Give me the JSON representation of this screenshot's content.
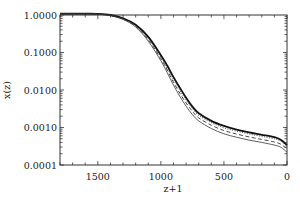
{
  "chart_data": {
    "type": "line",
    "title": "",
    "xlabel": "z+1",
    "ylabel": "x(z)",
    "x_reversed": true,
    "xlim": [
      1800,
      0
    ],
    "ylim": [
      0.0001,
      1.0
    ],
    "yscale": "log",
    "grid": false,
    "legend": null,
    "x_ticks": [
      1500,
      1000,
      500,
      0
    ],
    "x_tick_labels": [
      "1500",
      "1000",
      "500",
      "0"
    ],
    "y_ticks": [
      1.0,
      0.1,
      0.01,
      0.001,
      0.0001
    ],
    "y_tick_labels": [
      "1.0000",
      "0.1000",
      "0.0100",
      "0.0010",
      "0.0001"
    ],
    "series": [
      {
        "name": "solid (thick)",
        "style": "solid-thick",
        "x": [
          1800,
          1600,
          1500,
          1400,
          1300,
          1200,
          1100,
          1000,
          950,
          900,
          850,
          800,
          750,
          700,
          600,
          500,
          400,
          300,
          200,
          100,
          50,
          0
        ],
        "y": [
          1.08,
          1.08,
          1.07,
          1.0,
          0.82,
          0.55,
          0.26,
          0.085,
          0.045,
          0.022,
          0.0115,
          0.0062,
          0.0036,
          0.0024,
          0.0015,
          0.0011,
          0.00088,
          0.00074,
          0.00064,
          0.00055,
          0.00047,
          0.00034
        ]
      },
      {
        "name": "dotted",
        "style": "dotted",
        "x": [
          1800,
          1600,
          1500,
          1400,
          1300,
          1200,
          1100,
          1000,
          950,
          900,
          850,
          800,
          750,
          700,
          600,
          500,
          400,
          300,
          200,
          100,
          50,
          0
        ],
        "y": [
          1.08,
          1.08,
          1.06,
          0.98,
          0.79,
          0.52,
          0.24,
          0.075,
          0.038,
          0.019,
          0.0098,
          0.0054,
          0.0032,
          0.0021,
          0.00135,
          0.00098,
          0.0008,
          0.00067,
          0.00058,
          0.0005,
          0.00043,
          0.00032
        ]
      },
      {
        "name": "dashed",
        "style": "dashed",
        "x": [
          1800,
          1600,
          1500,
          1400,
          1300,
          1200,
          1100,
          1000,
          950,
          900,
          850,
          800,
          750,
          700,
          600,
          500,
          400,
          300,
          200,
          100,
          50,
          0
        ],
        "y": [
          1.08,
          1.08,
          1.06,
          0.97,
          0.78,
          0.5,
          0.22,
          0.068,
          0.034,
          0.016,
          0.0082,
          0.0045,
          0.0027,
          0.0018,
          0.00115,
          0.00083,
          0.00067,
          0.00056,
          0.00048,
          0.00041,
          0.00036,
          0.00027
        ]
      },
      {
        "name": "solid (thin)",
        "style": "solid-thin",
        "x": [
          1800,
          1600,
          1500,
          1400,
          1300,
          1200,
          1100,
          1000,
          950,
          900,
          850,
          800,
          750,
          700,
          600,
          500,
          400,
          300,
          200,
          100,
          50,
          0
        ],
        "y": [
          1.08,
          1.08,
          1.05,
          0.96,
          0.76,
          0.48,
          0.2,
          0.06,
          0.029,
          0.0135,
          0.0068,
          0.0037,
          0.0022,
          0.0015,
          0.00094,
          0.00068,
          0.00055,
          0.00046,
          0.0004,
          0.00034,
          0.0003,
          0.00022
        ]
      }
    ]
  },
  "axes": {
    "x_label": "z+1",
    "y_label": "x(z)"
  }
}
